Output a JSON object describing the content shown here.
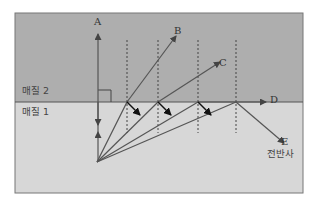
{
  "figure": {
    "medium_top_label": "매질 2",
    "medium_bottom_label": "매질 1",
    "rays": {
      "A": "A",
      "B": "B",
      "C": "C",
      "D": "D",
      "E": "E"
    },
    "total_reflection_label": "전반사",
    "colors": {
      "medium_top": "#aeaeae",
      "medium_bottom": "#d7d7d7",
      "line": "#555555",
      "border": "#777777"
    }
  }
}
